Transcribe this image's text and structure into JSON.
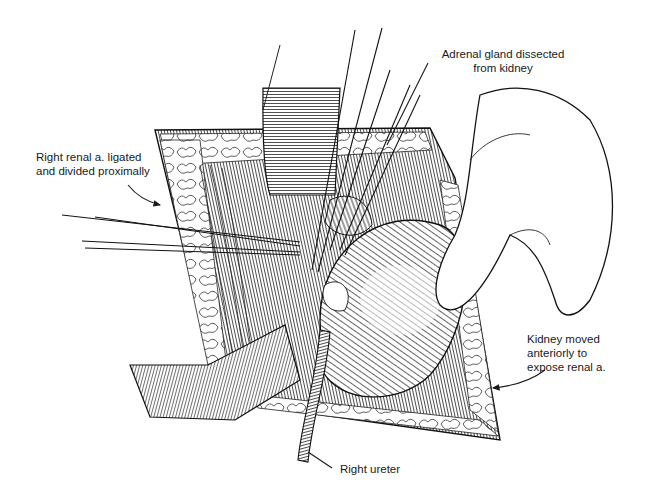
{
  "figure": {
    "colors": {
      "ink": "#1a1a1a",
      "background": "#ffffff"
    }
  },
  "labels": {
    "adrenal": {
      "line1": "Adrenal gland dissected",
      "line2": "from kidney"
    },
    "renal_artery": {
      "line1": "Right renal a. ligated",
      "line2": "and divided proximally"
    },
    "kidney": {
      "line1": "Kidney moved",
      "line2": "anteriorly to",
      "line3": "expose renal a."
    },
    "ureter": {
      "line1": "Right ureter"
    }
  }
}
